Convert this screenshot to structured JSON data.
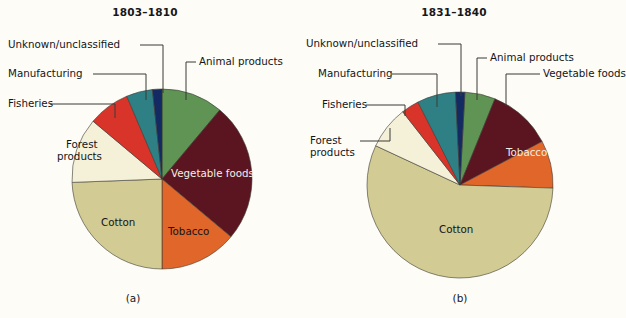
{
  "figure": {
    "background": "#fdfcf7",
    "outline_color": "#3a3a34"
  },
  "chart_data": [
    {
      "type": "pie",
      "panel": "(a)",
      "title": "1803–1810",
      "categories": [
        "Animal products",
        "Vegetable foods",
        "Tobacco",
        "Cotton",
        "Forest products",
        "Fisheries",
        "Manufacturing",
        "Unknown/unclassified"
      ],
      "values": [
        11.1,
        25.0,
        13.9,
        24.4,
        11.7,
        7.5,
        4.7,
        1.7
      ],
      "units": "percent of total exports",
      "colors": [
        "#5f9455",
        "#5b1520",
        "#e1662a",
        "#d2cb93",
        "#f5f0d8",
        "#d8342a",
        "#2e8085",
        "#142a63"
      ],
      "start_angle_deg": 0,
      "direction": "clockwise",
      "legend": "none",
      "labels_inside": [
        "Vegetable foods",
        "Tobacco",
        "Cotton",
        "Forest products"
      ],
      "labels_callout": [
        "Animal products",
        "Manufacturing",
        "Fisheries",
        "Unknown/unclassified"
      ]
    },
    {
      "type": "pie",
      "panel": "(b)",
      "title": "1831–1840",
      "categories": [
        "Animal products",
        "Vegetable foods",
        "Tobacco",
        "Cotton",
        "Forest products",
        "Fisheries",
        "Manufacturing",
        "Unknown/unclassified"
      ],
      "values": [
        5.3,
        11.1,
        8.3,
        56.4,
        7.5,
        3.1,
        6.7,
        1.6
      ],
      "units": "percent of total exports",
      "colors": [
        "#5f9455",
        "#5b1520",
        "#e1662a",
        "#d2cb93",
        "#f5f0d8",
        "#d8342a",
        "#2e8085",
        "#142a63"
      ],
      "start_angle_deg": 3,
      "direction": "clockwise",
      "legend": "none",
      "labels_inside": [
        "Tobacco",
        "Cotton"
      ],
      "labels_callout": [
        "Animal products",
        "Vegetable foods",
        "Manufacturing",
        "Fisheries",
        "Forest products"
      ]
    }
  ],
  "panel_a": {
    "title": "1803–1810",
    "caption": "(a)",
    "labels": {
      "unknown": "Unknown/unclassified",
      "manufacturing": "Manufacturing",
      "fisheries": "Fisheries",
      "animal": "Animal products",
      "forest_l1": "Forest",
      "forest_l2": "products",
      "vegetable": "Vegetable foods",
      "cotton": "Cotton",
      "tobacco": "Tobacco"
    }
  },
  "panel_b": {
    "title": "1831–1840",
    "caption": "(b)",
    "labels": {
      "unknown": "Unknown/unclassified",
      "manufacturing": "Manufacturing",
      "fisheries": "Fisheries",
      "animal": "Animal products",
      "vegetable": "Vegetable foods",
      "forest_l1": "Forest",
      "forest_l2": "products",
      "cotton": "Cotton",
      "tobacco": "Tobacco"
    }
  }
}
